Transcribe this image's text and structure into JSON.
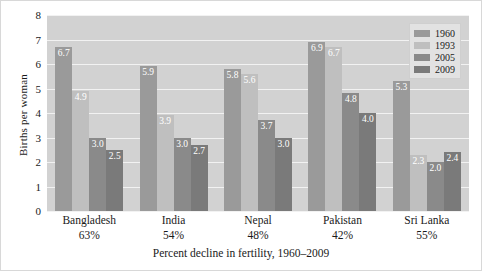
{
  "chart_data": {
    "type": "bar",
    "title": "",
    "xlabel": "Percent decline in fertility, 1960–2009",
    "ylabel": "Births per woman",
    "ylim": [
      0,
      8
    ],
    "yticks": [
      "0",
      "1",
      "2",
      "3",
      "4",
      "5",
      "6",
      "7",
      "8"
    ],
    "grid": true,
    "legend_position": "top-right",
    "categories": [
      "Bangladesh",
      "India",
      "Nepal",
      "Pakistan",
      "Sri Lanka"
    ],
    "category_sublabels": [
      "63%",
      "54%",
      "48%",
      "42%",
      "55%"
    ],
    "series": [
      {
        "name": "1960",
        "color": "#9a9a9a",
        "values": [
          6.7,
          5.9,
          5.8,
          6.9,
          5.3
        ]
      },
      {
        "name": "1993",
        "color": "#bfbfbf",
        "values": [
          4.9,
          3.9,
          5.6,
          6.7,
          2.3
        ]
      },
      {
        "name": "2005",
        "color": "#8a8a8a",
        "values": [
          3.0,
          3.0,
          3.7,
          4.8,
          2.0
        ]
      },
      {
        "name": "2009",
        "color": "#7a7a7a",
        "values": [
          2.5,
          2.7,
          3.0,
          4.0,
          2.4
        ]
      }
    ],
    "plot_background": "#d2d2d2",
    "gridline_color": "#f2f2f2",
    "value_label_color": "#ffffff"
  },
  "legend": {
    "items": [
      {
        "label": "1960"
      },
      {
        "label": "1993"
      },
      {
        "label": "2005"
      },
      {
        "label": "2009"
      }
    ]
  }
}
